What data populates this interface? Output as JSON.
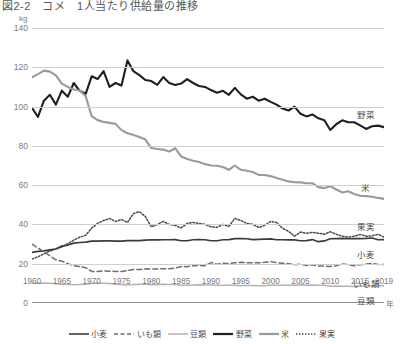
{
  "title": "図2-2　コメ　1人当たり供給量の推移",
  "unit_label": "kg",
  "xaxis_unit": "年",
  "yticks": [
    "140",
    "120",
    "100",
    "80",
    "60",
    "40",
    "20",
    "0"
  ],
  "xticks": [
    "1960",
    "1965",
    "1970",
    "1975",
    "1980",
    "1985",
    "1990",
    "1995",
    "2000",
    "2005",
    "2010",
    "2015",
    "2019"
  ],
  "series_labels": {
    "yasai": "野菜",
    "kome": "米",
    "kajitsu": "果実",
    "komugi": "小麦",
    "imorui": "いも類",
    "mamerui": "豆類"
  },
  "legend": [
    {
      "label": "小麦",
      "style": "solid",
      "color": "#3b3b3b",
      "width": 1.6
    },
    {
      "label": "いも類",
      "style": "dashed",
      "color": "#6e6e6e",
      "width": 1.4
    },
    {
      "label": "豆類",
      "style": "solid",
      "color": "#b3b3b3",
      "width": 1.5
    },
    {
      "label": "野菜",
      "style": "solid",
      "color": "#1f1f1f",
      "width": 2.2
    },
    {
      "label": "米",
      "style": "solid",
      "color": "#9a9a9a",
      "width": 2.2
    },
    {
      "label": "果実",
      "style": "dotted",
      "color": "#4a4a4a",
      "width": 1.5
    }
  ],
  "chart_data": {
    "type": "line",
    "title": "図2-2　コメ　1人当たり供給量の推移",
    "xlabel": "年",
    "ylabel": "kg",
    "ylim": [
      0,
      140
    ],
    "xlim": [
      1960,
      2019
    ],
    "grid": true,
    "legend_position": "bottom",
    "x": [
      1960,
      1961,
      1962,
      1963,
      1964,
      1965,
      1966,
      1967,
      1968,
      1969,
      1970,
      1971,
      1972,
      1973,
      1974,
      1975,
      1976,
      1977,
      1978,
      1979,
      1980,
      1981,
      1982,
      1983,
      1984,
      1985,
      1986,
      1987,
      1988,
      1989,
      1990,
      1991,
      1992,
      1993,
      1994,
      1995,
      1996,
      1997,
      1998,
      1999,
      2000,
      2001,
      2002,
      2003,
      2004,
      2005,
      2006,
      2007,
      2008,
      2009,
      2010,
      2011,
      2012,
      2013,
      2014,
      2015,
      2016,
      2017,
      2018,
      2019
    ],
    "series": [
      {
        "name": "野菜",
        "color": "#1f1f1f",
        "style": "solid",
        "values": [
          99.4,
          94.7,
          103.0,
          106.0,
          101.0,
          108.1,
          105.0,
          112.0,
          108.0,
          106.5,
          115.4,
          114.0,
          118.0,
          110.0,
          112.0,
          110.7,
          123.5,
          118.0,
          116.0,
          113.5,
          113.0,
          111.0,
          115.0,
          112.0,
          111.0,
          111.7,
          114.0,
          112.0,
          110.5,
          110.0,
          108.4,
          107.0,
          108.0,
          106.0,
          109.5,
          106.2,
          104.0,
          105.0,
          103.0,
          104.0,
          102.4,
          101.0,
          99.0,
          98.0,
          100.0,
          96.3,
          95.0,
          96.0,
          94.0,
          93.0,
          88.1,
          91.0,
          93.0,
          92.0,
          92.0,
          90.4,
          88.6,
          90.0,
          90.3,
          89.5
        ]
      },
      {
        "name": "米",
        "color": "#9a9a9a",
        "style": "solid",
        "values": [
          114.9,
          116.5,
          118.3,
          117.8,
          115.9,
          111.7,
          110.0,
          108.7,
          108.2,
          105.3,
          95.1,
          93.1,
          92.2,
          91.7,
          91.2,
          88.0,
          86.4,
          85.5,
          84.5,
          83.2,
          78.9,
          78.4,
          78.1,
          77.1,
          78.8,
          74.6,
          73.3,
          72.4,
          71.8,
          70.7,
          70.0,
          69.9,
          69.2,
          67.8,
          70.0,
          67.8,
          67.3,
          66.7,
          65.2,
          65.2,
          64.6,
          63.6,
          62.7,
          61.9,
          61.5,
          61.4,
          61.0,
          61.0,
          59.0,
          58.5,
          59.5,
          57.8,
          56.3,
          56.9,
          55.5,
          54.6,
          54.4,
          54.1,
          53.5,
          53.0
        ]
      },
      {
        "name": "果実",
        "color": "#4a4a4a",
        "style": "dotted",
        "values": [
          22.4,
          23.5,
          25.0,
          26.5,
          27.5,
          28.5,
          30.2,
          32.0,
          33.5,
          34.5,
          38.1,
          40.5,
          42.0,
          43.0,
          41.5,
          42.5,
          41.0,
          45.5,
          46.5,
          44.0,
          38.8,
          40.0,
          41.5,
          40.0,
          39.5,
          38.2,
          40.5,
          41.0,
          40.5,
          40.0,
          38.8,
          38.5,
          40.0,
          39.0,
          43.1,
          42.0,
          40.5,
          40.0,
          38.5,
          39.5,
          41.5,
          41.0,
          38.0,
          36.5,
          34.0,
          36.1,
          35.5,
          36.0,
          35.5,
          35.0,
          36.3,
          35.0,
          34.0,
          33.5,
          34.0,
          34.9,
          34.0,
          34.2,
          35.0,
          33.5
        ]
      },
      {
        "name": "小麦",
        "color": "#3b3b3b",
        "style": "solid",
        "values": [
          25.8,
          26.3,
          26.5,
          27.0,
          27.5,
          29.0,
          29.5,
          30.5,
          30.8,
          31.0,
          31.5,
          31.5,
          31.6,
          31.6,
          31.5,
          31.5,
          31.8,
          31.8,
          31.8,
          32.0,
          32.2,
          32.1,
          32.2,
          32.2,
          32.3,
          31.7,
          31.7,
          32.2,
          32.3,
          32.2,
          31.7,
          31.7,
          32.2,
          32.3,
          32.8,
          32.8,
          32.7,
          32.3,
          32.4,
          32.5,
          32.6,
          32.2,
          32.2,
          32.1,
          32.1,
          31.7,
          31.8,
          32.3,
          31.2,
          31.6,
          32.7,
          32.8,
          32.9,
          32.7,
          32.8,
          32.8,
          32.9,
          33.1,
          32.2,
          32.3
        ]
      },
      {
        "name": "いも類",
        "color": "#6e6e6e",
        "style": "dashed",
        "values": [
          30.0,
          28.0,
          26.0,
          24.0,
          22.0,
          21.3,
          20.0,
          19.0,
          18.5,
          18.0,
          16.1,
          16.0,
          16.4,
          16.2,
          16.1,
          16.0,
          16.5,
          17.0,
          17.0,
          17.4,
          17.3,
          17.3,
          17.5,
          17.4,
          17.8,
          18.6,
          18.5,
          19.0,
          19.1,
          19.0,
          20.6,
          19.7,
          20.3,
          20.0,
          20.5,
          20.7,
          20.5,
          20.5,
          20.5,
          20.7,
          21.1,
          20.5,
          20.3,
          20.0,
          19.5,
          19.7,
          19.1,
          19.5,
          18.8,
          18.8,
          18.6,
          19.0,
          19.8,
          19.6,
          19.0,
          19.5,
          19.8,
          20.2,
          19.6,
          19.6
        ]
      },
      {
        "name": "豆類",
        "color": "#b3b3b3",
        "style": "solid",
        "values": [
          10.1,
          10.0,
          10.2,
          10.0,
          9.8,
          9.5,
          9.4,
          9.3,
          9.4,
          9.5,
          10.1,
          10.2,
          10.1,
          9.9,
          9.5,
          9.4,
          9.2,
          9.4,
          9.5,
          9.6,
          9.3,
          9.4,
          9.5,
          9.4,
          9.4,
          9.0,
          9.1,
          9.2,
          9.3,
          9.2,
          9.2,
          9.1,
          9.0,
          9.1,
          9.0,
          8.8,
          8.9,
          8.9,
          8.8,
          8.8,
          9.0,
          9.0,
          9.0,
          9.1,
          9.1,
          9.3,
          9.1,
          9.2,
          9.0,
          9.0,
          8.5,
          8.6,
          8.5,
          8.5,
          8.4,
          8.5,
          8.6,
          8.7,
          8.8,
          8.8
        ]
      }
    ]
  }
}
